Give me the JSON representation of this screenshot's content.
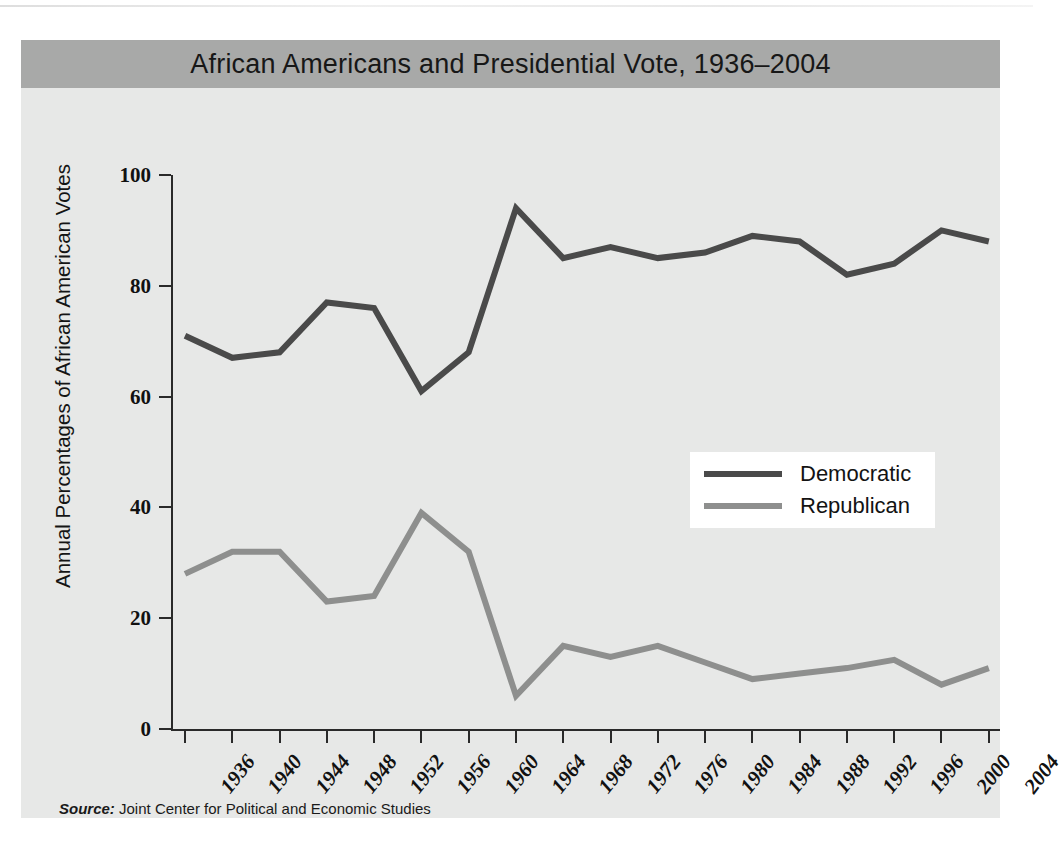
{
  "figure": {
    "title": "African Americans and Presidential Vote, 1936–2004",
    "source_prefix": "Source:",
    "source_text": " Joint Center for Political and Economic Studies",
    "title_bar_color": "#a8a9a8",
    "panel_color": "#e7e8e7"
  },
  "chart_data": {
    "type": "line",
    "title": "African Americans and Presidential Vote, 1936–2004",
    "xlabel": "",
    "ylabel": "Annual Percentages of African American Votes",
    "categories": [
      "1936",
      "1940",
      "1944",
      "1948",
      "1952",
      "1956",
      "1960",
      "1964",
      "1968",
      "1972",
      "1976",
      "1980",
      "1984",
      "1988",
      "1992",
      "1996",
      "2000",
      "2004"
    ],
    "x_tick_labels": [
      "1936",
      "1940",
      "1944",
      "1948",
      "1952",
      "1956",
      "1960",
      "1964",
      "1968",
      "1972",
      "1976",
      "1980",
      "1984",
      "1988",
      "1992",
      "1996",
      "2000",
      "2004"
    ],
    "y_tick_labels": [
      "0",
      "20",
      "40",
      "60",
      "80",
      "100"
    ],
    "y_ticks": [
      0,
      20,
      40,
      60,
      80,
      100
    ],
    "ylim": [
      0,
      100
    ],
    "grid": false,
    "legend_position": "center-right",
    "series": [
      {
        "name": "Democratic",
        "color": "#4a4a4a",
        "values": [
          71,
          67,
          68,
          77,
          76,
          61,
          68,
          94,
          85,
          87,
          85,
          86,
          89,
          88,
          82,
          84,
          90,
          88
        ]
      },
      {
        "name": "Republican",
        "color": "#8e8f8e",
        "values": [
          28,
          32,
          32,
          23,
          24,
          39,
          32,
          6,
          15,
          13,
          15,
          12,
          9,
          10,
          11,
          12.5,
          8,
          11
        ]
      }
    ]
  },
  "legend": {
    "items": [
      {
        "label": "Democratic",
        "color": "#4a4a4a"
      },
      {
        "label": "Republican",
        "color": "#8e8f8e"
      }
    ]
  }
}
